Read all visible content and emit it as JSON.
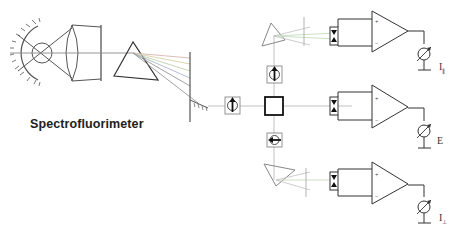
{
  "title": "Spectrofluorimeter",
  "labels": {
    "parallel": "I",
    "parallel_sub": "∥",
    "excitation": "E",
    "perpendicular": "I",
    "perpendicular_sub": "⊥"
  },
  "components": {
    "lamp": "xenon-lamp-with-reflector",
    "condenser": "lens",
    "monochromator": "prism",
    "exit_slit": "slit",
    "polarizer": "polarizer",
    "sample": "cuvette",
    "analyzers": [
      "analyzer-top",
      "analyzer-bottom"
    ],
    "detectors": [
      "photodiode-top",
      "photodiode-middle",
      "photodiode-bottom"
    ],
    "amplifiers": [
      "op-amp-top",
      "op-amp-middle",
      "op-amp-bottom"
    ],
    "meters": [
      "meter-parallel",
      "meter-excitation",
      "meter-perpendicular"
    ]
  },
  "colors": {
    "line": "#555555",
    "beam": "#bbbbbb",
    "beam_green": "#c6dcc0",
    "spectrum": [
      "#d8b8b0",
      "#d8d0a8",
      "#c0d0b0",
      "#a8b8c8",
      "#b0b0b0"
    ],
    "dark": "#222222"
  }
}
